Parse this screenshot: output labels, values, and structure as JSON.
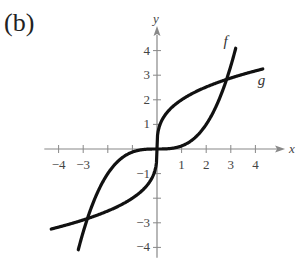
{
  "panel_label": "(b)",
  "chart_data": {
    "type": "line",
    "title": "",
    "xlabel": "x",
    "ylabel": "y",
    "xlim": [
      -4.5,
      4.8
    ],
    "ylim": [
      -4.5,
      4.8
    ],
    "x_ticks": [
      -4,
      -3,
      -2,
      -1,
      1,
      2,
      3,
      4
    ],
    "x_tick_labels": [
      "-4",
      "-3",
      "",
      "",
      "1",
      "2",
      "3",
      "4"
    ],
    "y_ticks": [
      -4,
      -3,
      -2,
      -1,
      1,
      2,
      3,
      4
    ],
    "y_tick_labels": [
      "-4",
      "-3",
      "",
      "-1",
      "1",
      "2",
      "3",
      "4"
    ],
    "grid": false,
    "series": [
      {
        "name": "f",
        "description": "steep cubic-shaped curve",
        "formula": "x^3/8",
        "x_range": [
          -3.2,
          3.2
        ]
      },
      {
        "name": "g",
        "description": "cube-root-shaped curve",
        "formula": "2*cbrt(x)",
        "x_range": [
          -4.3,
          4.3
        ]
      }
    ],
    "intersections": [
      [
        -2.83,
        -2.83
      ],
      [
        0,
        0
      ],
      [
        2.83,
        2.83
      ]
    ],
    "annotations": [
      {
        "text": "f",
        "x": 2.7,
        "y": 4.2
      },
      {
        "text": "g",
        "x": 4.1,
        "y": 2.6
      }
    ]
  }
}
